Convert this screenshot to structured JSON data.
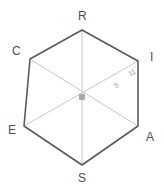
{
  "figure": {
    "shape_name": "hexagon",
    "stroke_color": "#5a5a5a",
    "diagonal_color": "#c8c8c8",
    "label_color": "#4d4d4d",
    "measure_color": "#9a9a9a",
    "background": "#ffffff",
    "center_marker": {
      "name": "center-point",
      "color": "#9a9a9a",
      "x": 82,
      "y": 97
    },
    "vertices": [
      {
        "label": "R",
        "x": 82,
        "y": 30,
        "label_x": 78,
        "label_y": 10
      },
      {
        "label": "I",
        "x": 138,
        "y": 61,
        "label_x": 150,
        "label_y": 51
      },
      {
        "label": "A",
        "x": 138,
        "y": 126,
        "label_x": 146,
        "label_y": 131
      },
      {
        "label": "S",
        "x": 82,
        "y": 165,
        "label_x": 78,
        "label_y": 172
      },
      {
        "label": "E",
        "x": 24,
        "y": 126,
        "label_x": 8,
        "label_y": 124
      },
      {
        "label": "C",
        "x": 30,
        "y": 59,
        "label_x": 12,
        "label_y": 45
      }
    ],
    "diagonals": [
      {
        "name": "diagonal-R-S",
        "from": "R",
        "to": "S"
      },
      {
        "name": "diagonal-C-A",
        "from": "C",
        "to": "A"
      },
      {
        "name": "diagonal-E-I",
        "from": "E",
        "to": "I"
      }
    ],
    "measurements": [
      {
        "name": "radius-length",
        "value": "5",
        "x": 113,
        "y": 83
      },
      {
        "name": "side-length",
        "value": "11",
        "x": 127,
        "y": 71
      }
    ]
  }
}
